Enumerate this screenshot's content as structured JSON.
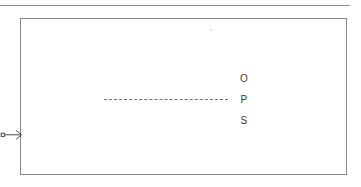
{
  "diagram": {
    "background_color": "#ffffff",
    "stroke_color": "#8a8a8a",
    "text_color": "#3b3b3b",
    "top_rule": {
      "name": "top-rule",
      "style": "solid"
    },
    "frame": {
      "name": "boundary-rectangle",
      "style": "solid"
    },
    "dashed_line": {
      "name": "centerline",
      "style": "dashed",
      "color": "#6f6f6f"
    },
    "inlet_arrow": {
      "name": "inlet-arrow",
      "direction": "right",
      "tail_marker": "square"
    },
    "labels": [
      {
        "text": "O"
      },
      {
        "text": "P"
      },
      {
        "text": "S"
      }
    ]
  }
}
